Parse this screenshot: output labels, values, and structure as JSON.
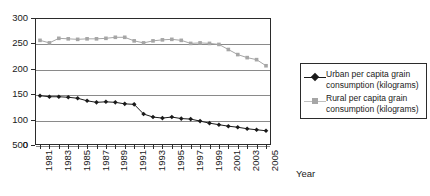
{
  "chart_data": {
    "type": "line",
    "title": "",
    "xlabel": "Year",
    "ylabel": "",
    "ylim": [
      50,
      300
    ],
    "y_ticks": [
      "300",
      "250",
      "200",
      "150",
      "100",
      "500"
    ],
    "y_tick_values": [
      300,
      250,
      200,
      150,
      100,
      50
    ],
    "extra_origin_tick": "0",
    "grid": true,
    "legend_position": "right",
    "x": [
      1981,
      1982,
      1983,
      1984,
      1985,
      1986,
      1987,
      1988,
      1989,
      1990,
      1991,
      1992,
      1993,
      1994,
      1995,
      1996,
      1997,
      1998,
      1999,
      2000,
      2001,
      2002,
      2003,
      2004,
      2005
    ],
    "x_tick_labels": [
      "1981",
      "1983",
      "1985",
      "1987",
      "1989",
      "1991",
      "1993",
      "1995",
      "1997",
      "1999",
      "2001",
      "2003",
      "2005"
    ],
    "series": [
      {
        "name": "Urban per capita grain consumption (kilograms)",
        "color": "#1a1a1a",
        "marker": "diamond",
        "values": [
          147,
          145,
          145,
          144,
          142,
          137,
          134,
          135,
          134,
          131,
          130,
          111,
          105,
          103,
          105,
          102,
          101,
          97,
          93,
          90,
          87,
          85,
          82,
          80,
          78
        ]
      },
      {
        "name": "Rural per capita grain consumption (kilograms)",
        "color": "#a6a6a6",
        "marker": "square",
        "values": [
          256,
          251,
          260,
          259,
          258,
          259,
          259,
          260,
          262,
          262,
          255,
          251,
          255,
          257,
          258,
          256,
          250,
          251,
          250,
          248,
          238,
          228,
          222,
          218,
          206
        ]
      }
    ]
  },
  "legend": {
    "entries": [
      {
        "label": "Urban per capita grain consumption (kilograms)"
      },
      {
        "label": "Rural per capita grain consumption (kilograms)"
      }
    ]
  },
  "axis": {
    "x_title": "Year"
  }
}
